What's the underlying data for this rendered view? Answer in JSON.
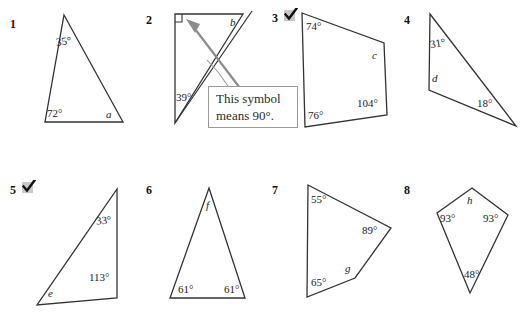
{
  "worksheet": {
    "callout": {
      "line1": "This symbol",
      "line2": "means 90°."
    },
    "problems": [
      {
        "number": "1",
        "checked": false,
        "shape": "triangle",
        "labels": [
          "35°",
          "72°",
          "a"
        ]
      },
      {
        "number": "2",
        "checked": false,
        "shape": "right-triangle",
        "labels": [
          "b",
          "39°"
        ]
      },
      {
        "number": "3",
        "checked": true,
        "shape": "quadrilateral",
        "labels": [
          "74°",
          "c",
          "104°",
          "76°"
        ]
      },
      {
        "number": "4",
        "checked": false,
        "shape": "triangle",
        "labels": [
          "31°",
          "d",
          "18°"
        ]
      },
      {
        "number": "5",
        "checked": true,
        "shape": "triangle",
        "labels": [
          "33°",
          "113°",
          "e"
        ]
      },
      {
        "number": "6",
        "checked": false,
        "shape": "triangle",
        "labels": [
          "f",
          "61°",
          "61°"
        ]
      },
      {
        "number": "7",
        "checked": false,
        "shape": "quadrilateral",
        "labels": [
          "55°",
          "89°",
          "g",
          "65°"
        ]
      },
      {
        "number": "8",
        "checked": false,
        "shape": "kite",
        "labels": [
          "h",
          "93°",
          "93°",
          "48°"
        ]
      }
    ]
  },
  "colors": {
    "ink": "#1a1a1a",
    "stroke": "#333333",
    "arrow": "#8c8c8c",
    "callout_border": "#9a9a9a",
    "check_shadow": "#c9c9c9"
  }
}
